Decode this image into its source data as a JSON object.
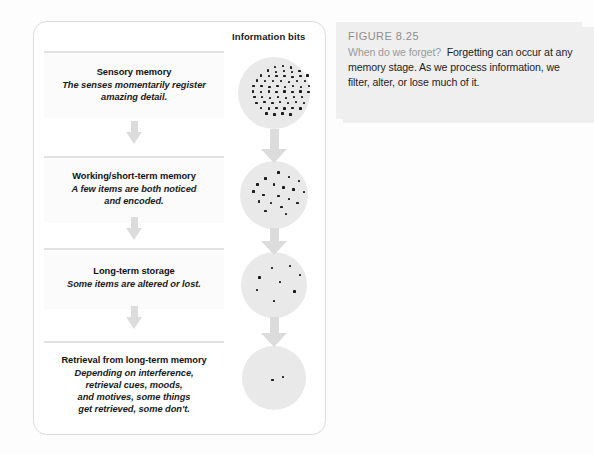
{
  "figure": {
    "number_label": "FIGURE 8.25",
    "caption_lead": "When do we forget?",
    "caption_body": "Forgetting can occur at any memory stage. As we process information, we filter, alter, or lose much of it.",
    "column_header": "Information bits"
  },
  "colors": {
    "panel_border": "#dcdcdc",
    "circle_fill": "#e9e9e9",
    "dot": "#1c1c1c",
    "arrow": "#dcdcdc",
    "caption_bg": "#eeeeee",
    "caption_lead_text": "#9a9a9a",
    "figure_number_text": "#8e8e8e",
    "divider": "#e2e2e2"
  },
  "stages": [
    {
      "title": "Sensory memory",
      "description_lines": [
        "The senses momentarily register",
        "amazing detail."
      ],
      "bit_count": 62
    },
    {
      "title": "Working/short-term memory",
      "description_lines": [
        "A few items are both noticed",
        "and encoded."
      ],
      "bit_count": 19
    },
    {
      "title": "Long-term storage",
      "description_lines": [
        "Some items are altered or lost."
      ],
      "bit_count": 7
    },
    {
      "title": "Retrieval from long-term memory",
      "description_lines": [
        "Depending on interference,",
        "retrieval cues, moods,",
        "and motives, some things",
        "get retrieved, some don't."
      ],
      "bit_count": 2
    }
  ],
  "chart_data": {
    "type": "diagram",
    "title": "When do we forget?",
    "categories": [
      "Sensory memory",
      "Working/short-term memory",
      "Long-term storage",
      "Retrieval from long-term memory"
    ],
    "values": [
      62,
      19,
      7,
      2
    ],
    "ylabel": "Information bits",
    "series_name": "Information bits retained"
  },
  "bit_positions": [
    [
      [
        50,
        12
      ],
      [
        61,
        11
      ],
      [
        72,
        13
      ],
      [
        40,
        17
      ],
      [
        51,
        19
      ],
      [
        62,
        18
      ],
      [
        73,
        19
      ],
      [
        84,
        18
      ],
      [
        30,
        24
      ],
      [
        41,
        25
      ],
      [
        52,
        25
      ],
      [
        63,
        25
      ],
      [
        74,
        26
      ],
      [
        85,
        25
      ],
      [
        95,
        24
      ],
      [
        25,
        31
      ],
      [
        36,
        32
      ],
      [
        47,
        32
      ],
      [
        58,
        32
      ],
      [
        69,
        33
      ],
      [
        80,
        32
      ],
      [
        91,
        32
      ],
      [
        20,
        39
      ],
      [
        31,
        39
      ],
      [
        42,
        40
      ],
      [
        53,
        39
      ],
      [
        64,
        40
      ],
      [
        75,
        39
      ],
      [
        86,
        40
      ],
      [
        97,
        39
      ],
      [
        19,
        46
      ],
      [
        30,
        47
      ],
      [
        41,
        46
      ],
      [
        52,
        47
      ],
      [
        63,
        46
      ],
      [
        74,
        47
      ],
      [
        85,
        46
      ],
      [
        96,
        47
      ],
      [
        21,
        54
      ],
      [
        32,
        54
      ],
      [
        43,
        55
      ],
      [
        54,
        54
      ],
      [
        65,
        55
      ],
      [
        76,
        54
      ],
      [
        87,
        54
      ],
      [
        24,
        62
      ],
      [
        35,
        61
      ],
      [
        46,
        62
      ],
      [
        57,
        61
      ],
      [
        68,
        62
      ],
      [
        79,
        61
      ],
      [
        90,
        62
      ],
      [
        30,
        69
      ],
      [
        41,
        70
      ],
      [
        52,
        69
      ],
      [
        63,
        70
      ],
      [
        74,
        69
      ],
      [
        85,
        70
      ],
      [
        38,
        77
      ],
      [
        49,
        78
      ],
      [
        60,
        77
      ],
      [
        71,
        78
      ]
    ],
    [
      [
        55,
        15
      ],
      [
        36,
        24
      ],
      [
        70,
        22
      ],
      [
        85,
        28
      ],
      [
        24,
        33
      ],
      [
        48,
        33
      ],
      [
        62,
        37
      ],
      [
        18,
        43
      ],
      [
        77,
        40
      ],
      [
        92,
        44
      ],
      [
        33,
        48
      ],
      [
        55,
        50
      ],
      [
        70,
        54
      ],
      [
        26,
        58
      ],
      [
        44,
        60
      ],
      [
        83,
        60
      ],
      [
        59,
        66
      ],
      [
        36,
        72
      ],
      [
        66,
        76
      ]
    ],
    [
      [
        45,
        22
      ],
      [
        72,
        19
      ],
      [
        26,
        37
      ],
      [
        88,
        33
      ],
      [
        57,
        44
      ],
      [
        22,
        56
      ],
      [
        79,
        58
      ],
      [
        48,
        72
      ]
    ],
    [
      [
        46,
        51
      ],
      [
        62,
        47
      ]
    ]
  ]
}
